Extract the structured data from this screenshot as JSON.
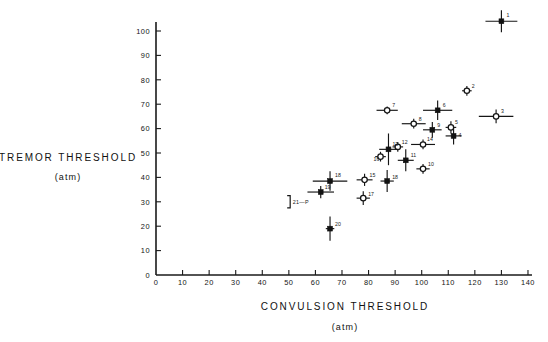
{
  "chart_data": {
    "type": "scatter",
    "title": "",
    "xlabel": "CONVULSION THRESHOLD",
    "xunit": "(atm)",
    "ylabel": "TREMOR THRESHOLD",
    "yunit": "(atm)",
    "xlim": [
      0,
      140
    ],
    "ylim": [
      0,
      108
    ],
    "xticks": [
      0,
      10,
      20,
      30,
      40,
      50,
      60,
      70,
      80,
      90,
      100,
      110,
      120,
      130,
      140
    ],
    "xticklabels": [
      "0",
      "10",
      "20",
      "30",
      "40",
      "50",
      "60",
      "70",
      "80",
      "90",
      "100",
      "110",
      "120",
      "130",
      "140"
    ],
    "yticks": [
      0,
      10,
      20,
      30,
      40,
      50,
      60,
      70,
      80,
      90,
      100
    ],
    "yticklabels": [
      "0",
      "10",
      "20",
      "30",
      "40",
      "50",
      "60",
      "70",
      "80",
      "90",
      "100"
    ],
    "grid": false,
    "legend": "none",
    "marker_styles": {
      "filled": "filled-square",
      "open": "open-circle"
    },
    "annotations": [
      {
        "name": "bracket-21-p",
        "label": "21—P",
        "x": 50.5,
        "y": 30.0,
        "bracket_y_low": 27.5,
        "bracket_y_high": 32.5
      }
    ],
    "points": [
      {
        "label": "1",
        "marker": "filled",
        "x": 130.0,
        "y": 104.0,
        "xerr": 6.0,
        "yerr": 4.5,
        "label_dx": 5,
        "label_dy": -4
      },
      {
        "label": "2",
        "marker": "open",
        "x": 117.0,
        "y": 75.5,
        "xerr": 1.8,
        "yerr": 2.0,
        "label_dx": 5,
        "label_dy": -3
      },
      {
        "label": "3",
        "marker": "open",
        "x": 128.0,
        "y": 65.0,
        "xerr": 6.5,
        "yerr": 2.8,
        "label_dx": 5,
        "label_dy": -3
      },
      {
        "label": "4",
        "marker": "filled",
        "x": 112.0,
        "y": 57.0,
        "xerr": 3.0,
        "yerr": 3.5,
        "label_dx": 5,
        "label_dy": 1
      },
      {
        "label": "5",
        "marker": "open",
        "x": 111.0,
        "y": 60.5,
        "xerr": 2.0,
        "yerr": 2.5,
        "label_dx": 4,
        "label_dy": -3
      },
      {
        "label": "6",
        "marker": "filled",
        "x": 106.0,
        "y": 67.5,
        "xerr": 5.5,
        "yerr": 4.0,
        "label_dx": 5,
        "label_dy": -3
      },
      {
        "label": "7",
        "marker": "open",
        "x": 87.0,
        "y": 67.5,
        "xerr": 4.0,
        "yerr": 1.6,
        "label_dx": 5,
        "label_dy": -3
      },
      {
        "label": "8",
        "marker": "open",
        "x": 97.0,
        "y": 62.0,
        "xerr": 4.5,
        "yerr": 2.0,
        "label_dx": 5,
        "label_dy": -3
      },
      {
        "label": "9",
        "marker": "filled",
        "x": 104.0,
        "y": 59.5,
        "xerr": 3.5,
        "yerr": 3.2,
        "label_dx": 5,
        "label_dy": -3
      },
      {
        "label": "10",
        "marker": "open",
        "x": 100.5,
        "y": 43.5,
        "xerr": 2.5,
        "yerr": 2.0,
        "label_dx": 5,
        "label_dy": -3
      },
      {
        "label": "11",
        "marker": "filled",
        "x": 94.0,
        "y": 47.0,
        "xerr": 3.0,
        "yerr": 4.5,
        "label_dx": 5,
        "label_dy": -3
      },
      {
        "label": "12",
        "marker": "open",
        "x": 91.0,
        "y": 52.5,
        "xerr": 2.0,
        "yerr": 2.0,
        "label_dx": 4,
        "label_dy": -3
      },
      {
        "label": "13",
        "marker": "filled",
        "x": 87.5,
        "y": 51.5,
        "xerr": 3.5,
        "yerr": 6.5,
        "label_dx": 4,
        "label_dy": -3
      },
      {
        "label": "14",
        "marker": "open",
        "x": 100.5,
        "y": 53.5,
        "xerr": 4.5,
        "yerr": 2.0,
        "label_dx": 4,
        "label_dy": -3
      },
      {
        "label": "15",
        "marker": "open",
        "x": 78.5,
        "y": 39.0,
        "xerr": 3.0,
        "yerr": 2.5,
        "label_dx": 5,
        "label_dy": -3
      },
      {
        "label": "16",
        "marker": "open",
        "x": 84.5,
        "y": 48.5,
        "xerr": 2.0,
        "yerr": 2.0,
        "label_dx": -7,
        "label_dy": 4
      },
      {
        "label": "17",
        "marker": "open",
        "x": 78.0,
        "y": 31.5,
        "xerr": 2.5,
        "yerr": 2.8,
        "label_dx": 5,
        "label_dy": -2
      },
      {
        "label": "18",
        "marker": "filled",
        "x": 87.0,
        "y": 38.5,
        "xerr": 2.5,
        "yerr": 4.5,
        "label_dx": 5,
        "label_dy": -2
      },
      {
        "label": "18b",
        "marker": "filled",
        "x": 65.5,
        "y": 38.5,
        "xerr": 6.5,
        "yerr": 4.0,
        "label_dx": 5,
        "label_dy": -4
      },
      {
        "label": "19",
        "marker": "filled",
        "x": 62.0,
        "y": 34.0,
        "xerr": 5.0,
        "yerr": 2.5,
        "label_dx": 4,
        "label_dy": -3
      },
      {
        "label": "20",
        "marker": "filled",
        "x": 65.5,
        "y": 19.0,
        "xerr": 1.6,
        "yerr": 5.0,
        "label_dx": 5,
        "label_dy": -3
      }
    ]
  },
  "geometry": {
    "origin_x": 156,
    "origin_y": 275,
    "px_per_x": 2.657,
    "px_per_y": 2.44,
    "y_axis_top": 22
  }
}
